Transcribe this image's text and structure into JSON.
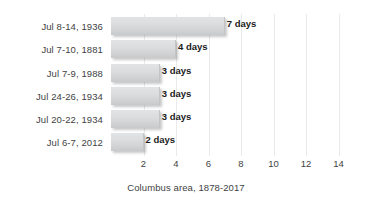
{
  "chart_data": {
    "type": "bar",
    "orientation": "horizontal",
    "title": "",
    "subtitle": "",
    "xlabel": "Columbus area, 1878-2017",
    "ylabel": "",
    "categories": [
      "Jul 8-14, 1936",
      "Jul 7-10, 1881",
      "Jul 7-9, 1988",
      "Jul 24-26, 1934",
      "Jul 20-22, 1934",
      "Jul 6-7, 2012"
    ],
    "values": [
      7,
      4,
      3,
      3,
      3,
      2
    ],
    "data_labels": [
      "7 days",
      "4 days",
      "3 days",
      "3 days",
      "3 days",
      "2 days"
    ],
    "xlim": [
      0,
      15
    ],
    "xticks": [
      2,
      4,
      6,
      8,
      10,
      12,
      14
    ],
    "xtick_labels": [
      "2",
      "4",
      "6",
      "8",
      "10",
      "12",
      "14"
    ],
    "grid": "vertical",
    "legend": "none",
    "unit": "days",
    "bar_color": "#d8d9db",
    "grid_color": "#eaeaea",
    "text_color": "#3f3f3f",
    "label_color": "#1c1c1c"
  },
  "axis_title": "Columbus area, 1878-2017"
}
